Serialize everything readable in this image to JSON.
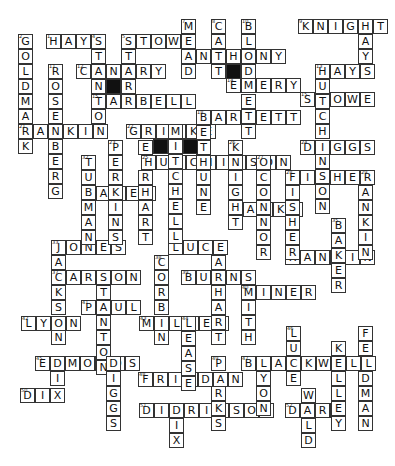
{
  "puzzle": {
    "cell_size": 15,
    "words": [
      {
        "answer": "HAYS",
        "x": 46,
        "y": 34,
        "dir": "across",
        "num": "1"
      },
      {
        "answer": "STOWE",
        "x": 121,
        "y": 34,
        "dir": "across",
        "num": "5"
      },
      {
        "answer": "KNIGHT",
        "x": 298,
        "y": 19,
        "dir": "across",
        "num": "9"
      },
      {
        "answer": "ANTHONY",
        "x": 181,
        "y": 49,
        "dir": "across",
        "num": ""
      },
      {
        "answer": "CANARY",
        "x": 76,
        "y": 64,
        "dir": "across",
        "num": "12"
      },
      {
        "answer": "HAYS",
        "x": 315,
        "y": 64,
        "dir": "across",
        "num": "13"
      },
      {
        "answer": "EMERY",
        "x": 226,
        "y": 78,
        "dir": "across",
        "num": "14"
      },
      {
        "answer": "TARBELL",
        "x": 91,
        "y": 94,
        "dir": "across",
        "num": "15"
      },
      {
        "answer": "STOWE",
        "x": 300,
        "y": 92,
        "dir": "across",
        "num": "15"
      },
      {
        "answer": "BARRETT",
        "x": 196,
        "y": 110,
        "dir": "across",
        "num": "18"
      },
      {
        "answer": "RANKIN",
        "x": 18,
        "y": 124,
        "dir": "across",
        "num": "21"
      },
      {
        "answer": "GRIMKE",
        "x": 126,
        "y": 124,
        "dir": "across",
        "num": "22"
      },
      {
        "answer": "DIGGS",
        "x": 300,
        "y": 140,
        "dir": "across",
        "num": "24"
      },
      {
        "answer": "HUTCHINSON",
        "x": 141,
        "y": 155,
        "dir": "across",
        "num": "25"
      },
      {
        "answer": "FISHER",
        "x": 285,
        "y": 170,
        "dir": "across",
        "num": "28"
      },
      {
        "answer": "BAKER",
        "x": 81,
        "y": 186,
        "dir": "across",
        "num": "30"
      },
      {
        "answer": "HANKS",
        "x": 228,
        "y": 202,
        "dir": "across",
        "num": "31"
      },
      {
        "answer": "JONES",
        "x": 51,
        "y": 240,
        "dir": "across",
        "num": "33"
      },
      {
        "answer": "LUCE",
        "x": 168,
        "y": 240,
        "dir": "across",
        "num": "34"
      },
      {
        "answer": "RANKIN",
        "x": 285,
        "y": 250,
        "dir": "across",
        "num": "36"
      },
      {
        "answer": "CARSON",
        "x": 51,
        "y": 270,
        "dir": "across",
        "num": "37"
      },
      {
        "answer": "BURNS",
        "x": 181,
        "y": 270,
        "dir": "across",
        "num": "39"
      },
      {
        "answer": "MINER",
        "x": 241,
        "y": 285,
        "dir": "across",
        "num": "40"
      },
      {
        "answer": "PAUL",
        "x": 81,
        "y": 300,
        "dir": "across",
        "num": "41"
      },
      {
        "answer": "LYON",
        "x": 21,
        "y": 316,
        "dir": "across",
        "num": "42"
      },
      {
        "answer": "MILLER",
        "x": 139,
        "y": 316,
        "dir": "across",
        "num": "43"
      },
      {
        "answer": "EDMONDS",
        "x": 35,
        "y": 356,
        "dir": "across",
        "num": "45"
      },
      {
        "answer": "BLACKWELL",
        "x": 241,
        "y": 356,
        "dir": "across",
        "num": "47"
      },
      {
        "answer": "FRIEDAN",
        "x": 138,
        "y": 372,
        "dir": "across",
        "num": "48"
      },
      {
        "answer": "DIX",
        "x": 20,
        "y": 388,
        "dir": "across",
        "num": "50"
      },
      {
        "answer": "DIDRIKSON",
        "x": 139,
        "y": 403,
        "dir": "across",
        "num": "51"
      },
      {
        "answer": "DARE",
        "x": 285,
        "y": 403,
        "dir": "across",
        "num": "52"
      },
      {
        "answer": "GOLDMARK",
        "x": 18,
        "y": 34,
        "dir": "down",
        "num": "2"
      },
      {
        "answer": "STANTON",
        "x": 91,
        "y": 34,
        "dir": "down",
        "num": "4"
      },
      {
        "answer": "STARR",
        "x": 121,
        "y": 34,
        "dir": "down",
        "num": "6"
      },
      {
        "answer": "MEAD",
        "x": 181,
        "y": 19,
        "dir": "down",
        "num": "7"
      },
      {
        "answer": "CATT",
        "x": 211,
        "y": 19,
        "dir": "down",
        "num": "8"
      },
      {
        "answer": "BLODGETT",
        "x": 241,
        "y": 19,
        "dir": "down",
        "num": "10"
      },
      {
        "answer": "HAYS",
        "x": 358,
        "y": 19,
        "dir": "down",
        "num": ""
      },
      {
        "answer": "ROSENBERG",
        "x": 48,
        "y": 64,
        "dir": "down",
        "num": "11"
      },
      {
        "answer": "HUTCHINSON",
        "x": 315,
        "y": 64,
        "dir": "down",
        "num": ""
      },
      {
        "answer": "BETHUNE",
        "x": 196,
        "y": 110,
        "dir": "down",
        "num": ""
      },
      {
        "answer": "PERKINS",
        "x": 108,
        "y": 140,
        "dir": "down",
        "num": "23"
      },
      {
        "answer": "EARHART",
        "x": 138,
        "y": 140,
        "dir": "down",
        "num": ""
      },
      {
        "answer": "MITCHELL",
        "x": 168,
        "y": 124,
        "dir": "down",
        "num": ""
      },
      {
        "answer": "KNIGHT",
        "x": 228,
        "y": 140,
        "dir": "down",
        "num": "26"
      },
      {
        "answer": "OCONNOR",
        "x": 256,
        "y": 155,
        "dir": "down",
        "num": "27"
      },
      {
        "answer": "FISHER",
        "x": 285,
        "y": 170,
        "dir": "down",
        "num": ""
      },
      {
        "answer": "RANKIN",
        "x": 358,
        "y": 170,
        "dir": "down",
        "num": "29"
      },
      {
        "answer": "TUBMAN",
        "x": 81,
        "y": 155,
        "dir": "down",
        "num": "32"
      },
      {
        "answer": "BAKER",
        "x": 331,
        "y": 218,
        "dir": "down",
        "num": "35"
      },
      {
        "answer": "JACKSON",
        "x": 51,
        "y": 240,
        "dir": "down",
        "num": ""
      },
      {
        "answer": "CORBIN",
        "x": 154,
        "y": 255,
        "dir": "down",
        "num": "38"
      },
      {
        "answer": "EARHART",
        "x": 211,
        "y": 240,
        "dir": "down",
        "num": ""
      },
      {
        "answer": "STANTON",
        "x": 96,
        "y": 270,
        "dir": "down",
        "num": ""
      },
      {
        "answer": "SMITH",
        "x": 241,
        "y": 270,
        "dir": "down",
        "num": ""
      },
      {
        "answer": "LEASE",
        "x": 181,
        "y": 316,
        "dir": "down",
        "num": "44"
      },
      {
        "answer": "LUCE",
        "x": 286,
        "y": 326,
        "dir": "down",
        "num": "46"
      },
      {
        "answer": "FELDMAN",
        "x": 358,
        "y": 326,
        "dir": "down",
        "num": ""
      },
      {
        "answer": "KELLEY",
        "x": 331,
        "y": 341,
        "dir": "down",
        "num": ""
      },
      {
        "answer": "DIX",
        "x": 50,
        "y": 356,
        "dir": "down",
        "num": ""
      },
      {
        "answer": "DIGGS",
        "x": 106,
        "y": 356,
        "dir": "down",
        "num": ""
      },
      {
        "answer": "PARKS",
        "x": 211,
        "y": 356,
        "dir": "down",
        "num": "49"
      },
      {
        "answer": "LYON",
        "x": 256,
        "y": 356,
        "dir": "down",
        "num": ""
      },
      {
        "answer": "WALD",
        "x": 301,
        "y": 388,
        "dir": "down",
        "num": ""
      },
      {
        "answer": "DIX",
        "x": 169,
        "y": 403,
        "dir": "down",
        "num": ""
      }
    ],
    "black_cells": [
      {
        "x": 106,
        "y": 79
      },
      {
        "x": 226,
        "y": 64
      },
      {
        "x": 153,
        "y": 139
      },
      {
        "x": 183,
        "y": 139
      }
    ]
  }
}
